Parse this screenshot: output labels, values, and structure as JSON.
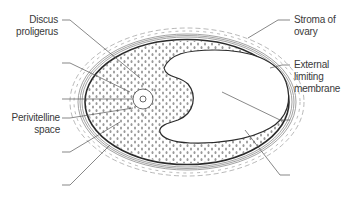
{
  "diagram": {
    "type": "anatomical illustration",
    "colors": {
      "outline": "#2b2b2b",
      "leader_line": "#555555",
      "cell_dot": "#9a9a9a",
      "theca_band": "#8c8c8c",
      "label_text": "#3a3a3a",
      "background": "#ffffff"
    }
  },
  "labels": {
    "discus_proligerus": {
      "line1": "Discus",
      "line2": "proligerus"
    },
    "perivitelline_space": {
      "line1": "Perivitelline",
      "line2": "space"
    },
    "stroma_of_ovary": {
      "line1": "Stroma of",
      "line2": "ovary"
    },
    "external_limiting_membrane": {
      "line1": "External",
      "line2": "limiting",
      "line3": "membrane"
    }
  },
  "unlabeled_leaders": {
    "left": 5,
    "right": 2
  }
}
